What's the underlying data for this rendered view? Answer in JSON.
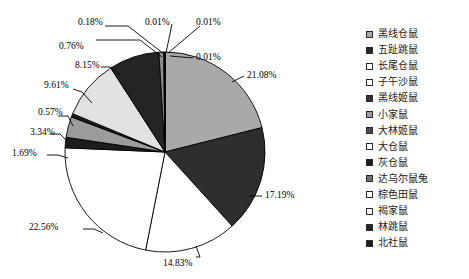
{
  "chart_data": {
    "type": "pie",
    "title": "",
    "subtitle": "",
    "xlabel": "",
    "ylabel": "",
    "legend_position": "right",
    "grid": false,
    "start_angle_deg": 0,
    "direction": "clockwise",
    "categories": [
      "黑线仓鼠",
      "五趾跳鼠",
      "长尾仓鼠",
      "子午沙鼠",
      "黑线姬鼠",
      "小家鼠",
      "大林姬鼠",
      "大仓鼠",
      "灰仓鼠",
      "达乌尔鼠兔",
      "棕色田鼠",
      "褐家鼠",
      "林跳鼠",
      "北社鼠"
    ],
    "values": [
      21.08,
      17.19,
      14.83,
      22.56,
      1.69,
      3.34,
      0.57,
      9.61,
      8.15,
      0.76,
      0.18,
      0.01,
      0.01,
      0.01
    ],
    "value_labels": [
      "21.08%",
      "17.19%",
      "14.83%",
      "22.56%",
      "1.69%",
      "3.34%",
      "0.57%",
      "9.61%",
      "8.15%",
      "0.76%",
      "0.18%",
      "0.01%",
      "0.01%",
      "0.01%"
    ],
    "unit": "%",
    "slice_colors": [
      "#a9a9a9",
      "#2e2e2e",
      "#ffffff",
      "#ffffff",
      "#1c1c1c",
      "#9c9c9c",
      "#1c1c1c",
      "#e2e2e2",
      "#242424",
      "#8e8e8e",
      "#ffffff",
      "#2e2e2e",
      "#8e8e8e",
      "#1c1c1c"
    ]
  },
  "legend": {
    "items": [
      {
        "label": "黑线仓鼠",
        "swatch": "#a9a9a9"
      },
      {
        "label": "五趾跳鼠",
        "swatch": "#262626"
      },
      {
        "label": "长尾仓鼠",
        "swatch": "#ffffff"
      },
      {
        "label": "子午沙鼠",
        "swatch": "#ffffff"
      },
      {
        "label": "黑线姬鼠",
        "swatch": "#333333"
      },
      {
        "label": "小家鼠",
        "swatch": "#9c9c9c"
      },
      {
        "label": "大林姬鼠",
        "swatch": "#4a4a4a"
      },
      {
        "label": "大仓鼠",
        "swatch": "#ffffff"
      },
      {
        "label": "灰仓鼠",
        "swatch": "#1c1c1c"
      },
      {
        "label": "达乌尔鼠兔",
        "swatch": "#6e6e6e"
      },
      {
        "label": "棕色田鼠",
        "swatch": "#ffffff"
      },
      {
        "label": "褐家鼠",
        "swatch": "#ffffff"
      },
      {
        "label": "林跳鼠",
        "swatch": "#262626"
      },
      {
        "label": "北社鼠",
        "swatch": "#1c1c1c"
      }
    ]
  },
  "labels": {
    "p_21_08": "21.08%",
    "p_17_19": "17.19%",
    "p_14_83": "14.83%",
    "p_22_56": "22.56%",
    "p_1_69": "1.69%",
    "p_3_34": "3.34%",
    "p_0_57": "0.57%",
    "p_9_61": "9.61%",
    "p_8_15": "8.15%",
    "p_0_76": "0.76%",
    "p_0_18": "0.18%",
    "p_0_01_a": "0.01%",
    "p_0_01_b": "0.01%",
    "p_0_01_c": "0.01%"
  }
}
